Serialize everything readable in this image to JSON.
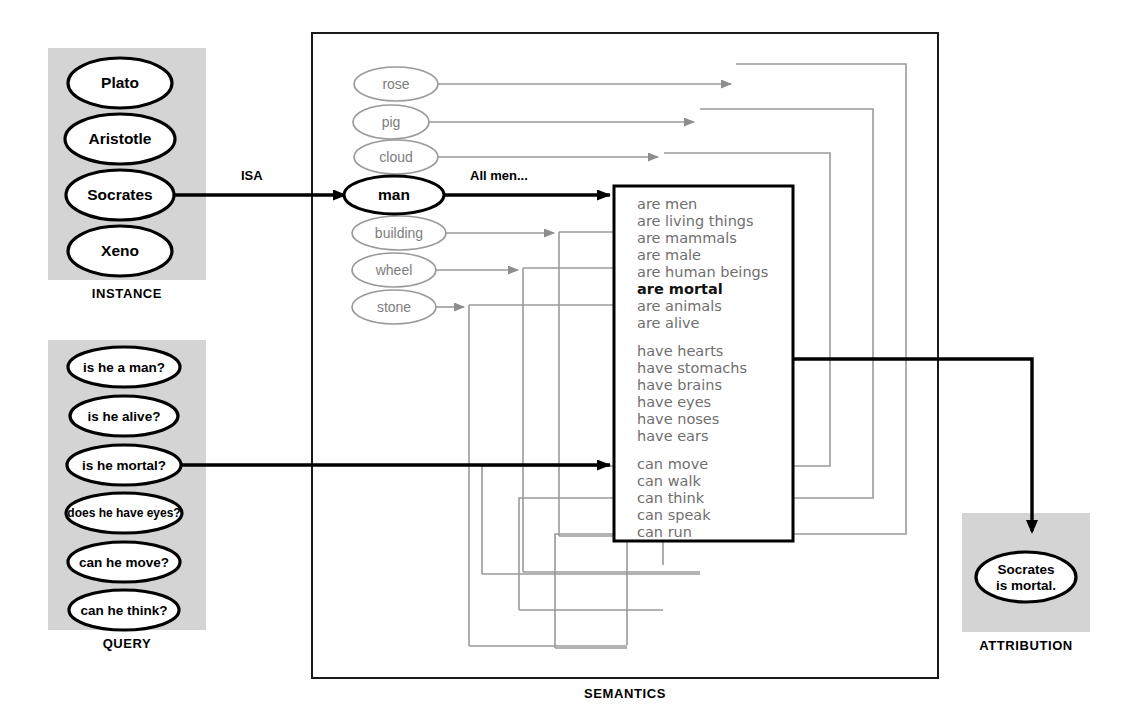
{
  "diagram": {
    "colors": {
      "panel_gray": "#d3d3d3",
      "faint_gray": "#8d8d8d",
      "ink": "#000000",
      "list_gray": "#6f6f6f"
    }
  },
  "panels": {
    "instance": {
      "label": "INSTANCE",
      "items": [
        {
          "label": "Plato",
          "highlighted": false
        },
        {
          "label": "Aristotle",
          "highlighted": false
        },
        {
          "label": "Socrates",
          "highlighted": true
        },
        {
          "label": "Xeno",
          "highlighted": false
        }
      ]
    },
    "query": {
      "label": "QUERY",
      "items": [
        {
          "label": "is he a man?",
          "highlighted": false
        },
        {
          "label": "is he alive?",
          "highlighted": false
        },
        {
          "label": "is he mortal?",
          "highlighted": true
        },
        {
          "label": "does he have eyes?",
          "highlighted": false
        },
        {
          "label": "can he move?",
          "highlighted": false
        },
        {
          "label": "can he think?",
          "highlighted": false
        }
      ]
    },
    "semantics": {
      "label": "SEMANTICS",
      "concepts": [
        {
          "label": "rose",
          "highlighted": false
        },
        {
          "label": "pig",
          "highlighted": false
        },
        {
          "label": "cloud",
          "highlighted": false
        },
        {
          "label": "man",
          "highlighted": true
        },
        {
          "label": "building",
          "highlighted": false
        },
        {
          "label": "wheel",
          "highlighted": false
        },
        {
          "label": "stone",
          "highlighted": false
        }
      ],
      "properties": {
        "group_are": [
          {
            "text": "are men",
            "bold": false
          },
          {
            "text": "are living things",
            "bold": false
          },
          {
            "text": "are mammals",
            "bold": false
          },
          {
            "text": "are male",
            "bold": false
          },
          {
            "text": "are human beings",
            "bold": false
          },
          {
            "text": "are mortal",
            "bold": true
          },
          {
            "text": "are animals",
            "bold": false
          },
          {
            "text": "are alive",
            "bold": false
          }
        ],
        "group_have": [
          {
            "text": "have hearts",
            "bold": false
          },
          {
            "text": "have stomachs",
            "bold": false
          },
          {
            "text": "have brains",
            "bold": false
          },
          {
            "text": "have eyes",
            "bold": false
          },
          {
            "text": "have noses",
            "bold": false
          },
          {
            "text": "have ears",
            "bold": false
          }
        ],
        "group_can": [
          {
            "text": "can move",
            "bold": false
          },
          {
            "text": "can walk",
            "bold": false
          },
          {
            "text": "can think",
            "bold": false
          },
          {
            "text": "can speak",
            "bold": false
          },
          {
            "text": "can run",
            "bold": false
          }
        ]
      }
    },
    "attribution": {
      "label": "ATTRIBUTION",
      "result": {
        "line1": "Socrates",
        "line2": "is mortal."
      }
    }
  },
  "edges": {
    "isa_label": "ISA",
    "all_men_label": "All men..."
  }
}
